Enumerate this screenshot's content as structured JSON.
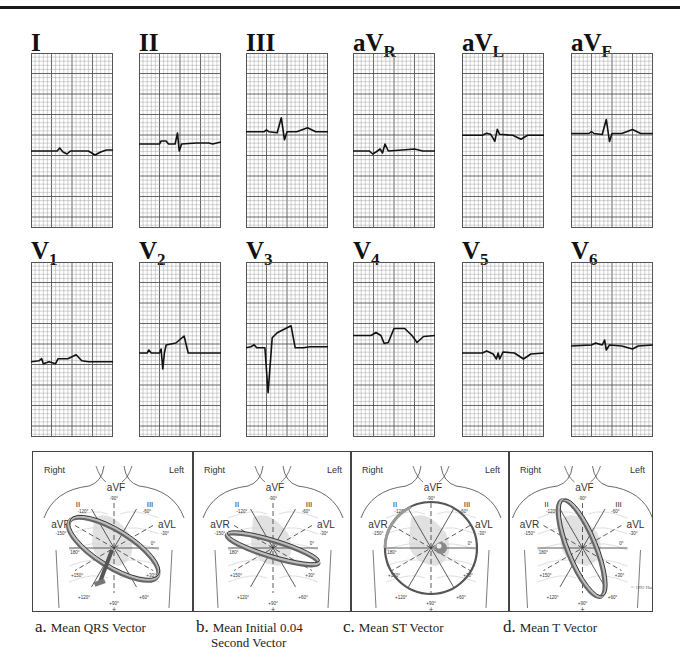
{
  "figure": {
    "limb_leads": [
      {
        "id": "I",
        "main": "I",
        "sub": "",
        "x": 31,
        "baseline": 0.56,
        "trace": "flatlow"
      },
      {
        "id": "II",
        "main": "II",
        "sub": "",
        "x": 139,
        "baseline": 0.52,
        "trace": "qrs_small_up"
      },
      {
        "id": "III",
        "main": "III",
        "sub": "",
        "x": 246,
        "baseline": 0.45,
        "trace": "qrs_up"
      },
      {
        "id": "aVR",
        "main": "aV",
        "sub": "R",
        "x": 353,
        "baseline": 0.56,
        "trace": "avr"
      },
      {
        "id": "aVL",
        "main": "aV",
        "sub": "L",
        "x": 462,
        "baseline": 0.47,
        "trace": "avl"
      },
      {
        "id": "aVF",
        "main": "aV",
        "sub": "F",
        "x": 571,
        "baseline": 0.46,
        "trace": "qrs_up"
      }
    ],
    "chest_leads": [
      {
        "id": "V1",
        "main": "V",
        "sub": "1",
        "x": 31,
        "baseline": 0.57,
        "trace": "v1"
      },
      {
        "id": "V2",
        "main": "V",
        "sub": "2",
        "x": 139,
        "baseline": 0.52,
        "trace": "v2"
      },
      {
        "id": "V3",
        "main": "V",
        "sub": "3",
        "x": 246,
        "baseline": 0.49,
        "trace": "v3"
      },
      {
        "id": "V4",
        "main": "V",
        "sub": "4",
        "x": 353,
        "baseline": 0.42,
        "trace": "v4"
      },
      {
        "id": "V5",
        "main": "V",
        "sub": "5",
        "x": 462,
        "baseline": 0.52,
        "trace": "v5"
      },
      {
        "id": "V6",
        "main": "V",
        "sub": "6",
        "x": 571,
        "baseline": 0.48,
        "trace": "v6"
      }
    ],
    "vector_panels": [
      {
        "letter": "a.",
        "title": "Mean QRS Vector",
        "title_line2": "",
        "left_label": "Right",
        "right_label": "Left",
        "ring": "qrs",
        "copyright": ""
      },
      {
        "letter": "b.",
        "title": "Mean Initial 0.04",
        "title_line2": "Second Vector",
        "left_label": "Right",
        "right_label": "Left",
        "ring": "initial",
        "copyright": ""
      },
      {
        "letter": "c.",
        "title": "Mean ST Vector",
        "title_line2": "",
        "left_label": "Right",
        "right_label": "Left",
        "ring": "st",
        "copyright": ""
      },
      {
        "letter": "d.",
        "title": "Mean T Vector",
        "title_line2": "",
        "left_label": "Right",
        "right_label": "Left",
        "ring": "t",
        "copyright": "© 1992 Hurst"
      }
    ],
    "hexaxial_labels": {
      "aVF": "aVF",
      "II": "II",
      "III": "III",
      "aVR": "aVR",
      "aVL": "aVL",
      "minus90": "-90°",
      "minus120": "-120°",
      "minus60": "-60°",
      "minus150": "-150°",
      "minus30": "-30°",
      "deg180": "180°",
      "deg0": "0°",
      "plus150": "+150°",
      "plus30": "+30°",
      "plus120": "+120°",
      "plus60": "+60°",
      "plus90": "+90°"
    }
  }
}
